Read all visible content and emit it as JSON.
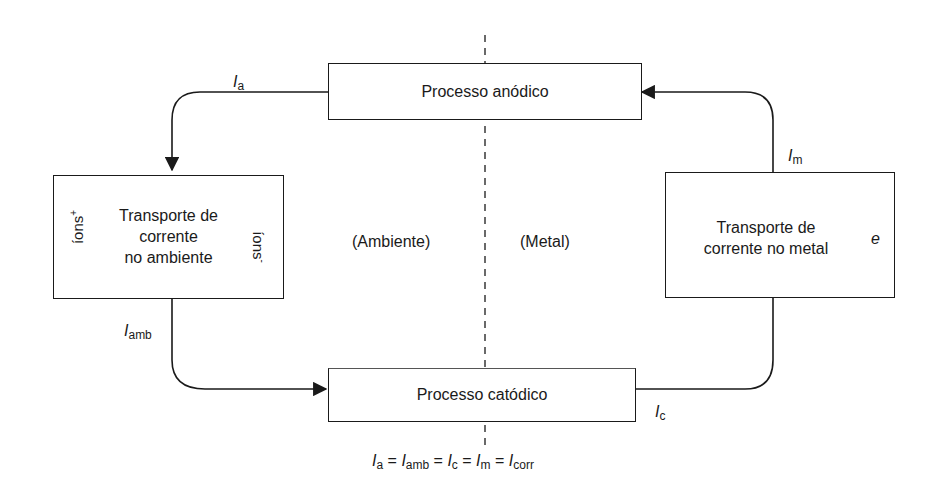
{
  "diagram": {
    "boxes": {
      "anodic": "Processo anódico",
      "cathodic": "Processo catódico",
      "ambient": [
        "Transporte de",
        "corrente",
        "no ambiente"
      ],
      "metal": [
        "Transporte de",
        "corrente no metal"
      ]
    },
    "regions": {
      "left": "(Ambiente)",
      "right": "(Metal)"
    },
    "currents": {
      "anodic": {
        "symbol": "I",
        "sub": "a"
      },
      "ambient": {
        "symbol": "I",
        "sub": "amb"
      },
      "cathodic": {
        "symbol": "I",
        "sub": "c"
      },
      "metal": {
        "symbol": "I",
        "sub": "m"
      }
    },
    "ions": {
      "positive": {
        "text": "íons",
        "sup": "+"
      },
      "negative": {
        "text": "íons",
        "sup": "-"
      }
    },
    "electron": "e",
    "equation": [
      {
        "symbol": "I",
        "sub": "a"
      },
      {
        "symbol": "I",
        "sub": "amb"
      },
      {
        "symbol": "I",
        "sub": "c"
      },
      {
        "symbol": "I",
        "sub": "m"
      },
      {
        "symbol": "I",
        "sub": "corr"
      }
    ],
    "equation_sep": " = "
  }
}
